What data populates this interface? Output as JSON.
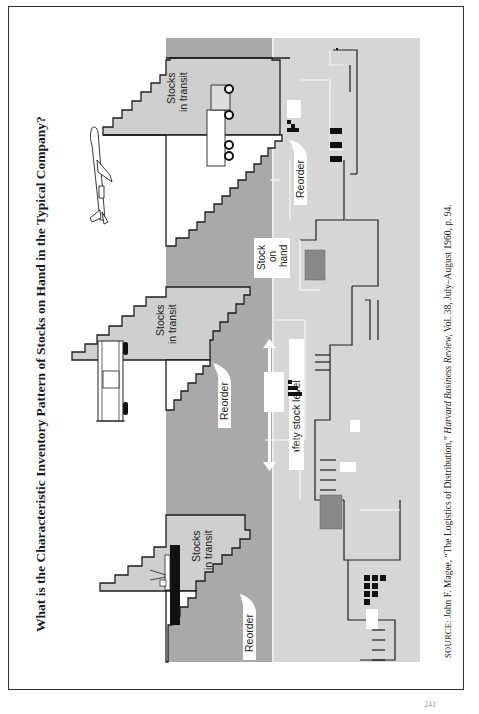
{
  "figure": {
    "title": "What is the Characteristic Inventory Pattern of Stocks on Hand in the Typical Company?",
    "orientation": "rotated 90° counter-clockwise",
    "labels": {
      "stocks_in_transit_line1": "Stocks",
      "stocks_in_transit_line2": "in transit",
      "reorder": "Reorder",
      "stock_on_hand_line1": "Stock",
      "stock_on_hand_line2": "on",
      "stock_on_hand_line3": "hand",
      "safety_stock_level": "Safety stock level"
    },
    "transport_modes": [
      {
        "cycle": 1,
        "vehicle": "ship",
        "label": "Stocks in transit"
      },
      {
        "cycle": 2,
        "vehicle": "railroad car",
        "label": "Stocks in transit"
      },
      {
        "cycle": 3,
        "vehicle": "truck",
        "label": "Stocks in transit"
      },
      {
        "cycle": 3,
        "vehicle": "airplane",
        "label": ""
      }
    ],
    "reorder_points": 3,
    "colors": {
      "stock_on_hand_dark": "#a9a9a9",
      "safety_stock_light": "#d6d6d6",
      "in_transit": "#cfcfcf",
      "outline": "#1e1e1e",
      "white_label_bg": "#ffffff"
    }
  },
  "source": {
    "prefix": "SOURCE:",
    "author": "John F. Magee, “The Logistics of Distribution,”",
    "journal": "Harvard Business Review,",
    "details": "Vol. 38, July–August 1960, p. 94."
  },
  "page": {
    "number": "241"
  }
}
